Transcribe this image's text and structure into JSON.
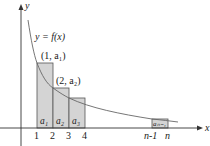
{
  "diagram": {
    "axes": {
      "x_label": "x",
      "y_label": "y"
    },
    "curve_label": "y = f(x)",
    "points": [
      {
        "label": "(1, a₁)",
        "x": 1
      },
      {
        "label": "(2, a₂)",
        "x": 2
      }
    ],
    "bars": [
      {
        "label": "a₁",
        "from": 1,
        "to": 2
      },
      {
        "label": "a₂",
        "from": 2,
        "to": 3
      },
      {
        "label": "a₃",
        "from": 3,
        "to": 4
      },
      {
        "label": "aₙ₋₁",
        "from": "n-1",
        "to": "n"
      }
    ],
    "x_ticks": [
      "1",
      "2",
      "3",
      "4",
      "n-1",
      "n"
    ],
    "colors": {
      "bar_fill": "#d4d4d4",
      "bar_stroke": "#555555",
      "curve": "#666666",
      "axis": "#333333"
    }
  }
}
